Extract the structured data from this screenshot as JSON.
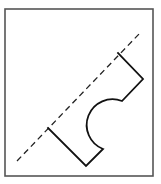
{
  "diagram": {
    "frame": {
      "x": 5,
      "y": 9,
      "width": 148,
      "height": 167,
      "stroke": "#555555",
      "stroke_width": 1.6
    },
    "fold_line": {
      "style": "dashed",
      "x1": 17,
      "y1": 161,
      "x2": 140,
      "y2": 33,
      "stroke": "#222222",
      "stroke_width": 1.3,
      "dasharray": "6 4"
    },
    "shape": {
      "description": "open polyline with a semicircular notch; its open ends lie on the dashed line",
      "stroke": "#111111",
      "stroke_width": 1.8,
      "vertices": [
        {
          "x": 48,
          "y": 128,
          "note": "on dashed line"
        },
        {
          "x": 86,
          "y": 166
        },
        {
          "x": 103,
          "y": 149
        },
        {
          "arc_to": {
            "x": 122,
            "y": 101
          },
          "note": "semicircular notch, bulging toward lower-left"
        },
        {
          "x": 143,
          "y": 79
        },
        {
          "x": 118,
          "y": 53,
          "note": "on dashed line"
        }
      ]
    },
    "text_labels": []
  }
}
